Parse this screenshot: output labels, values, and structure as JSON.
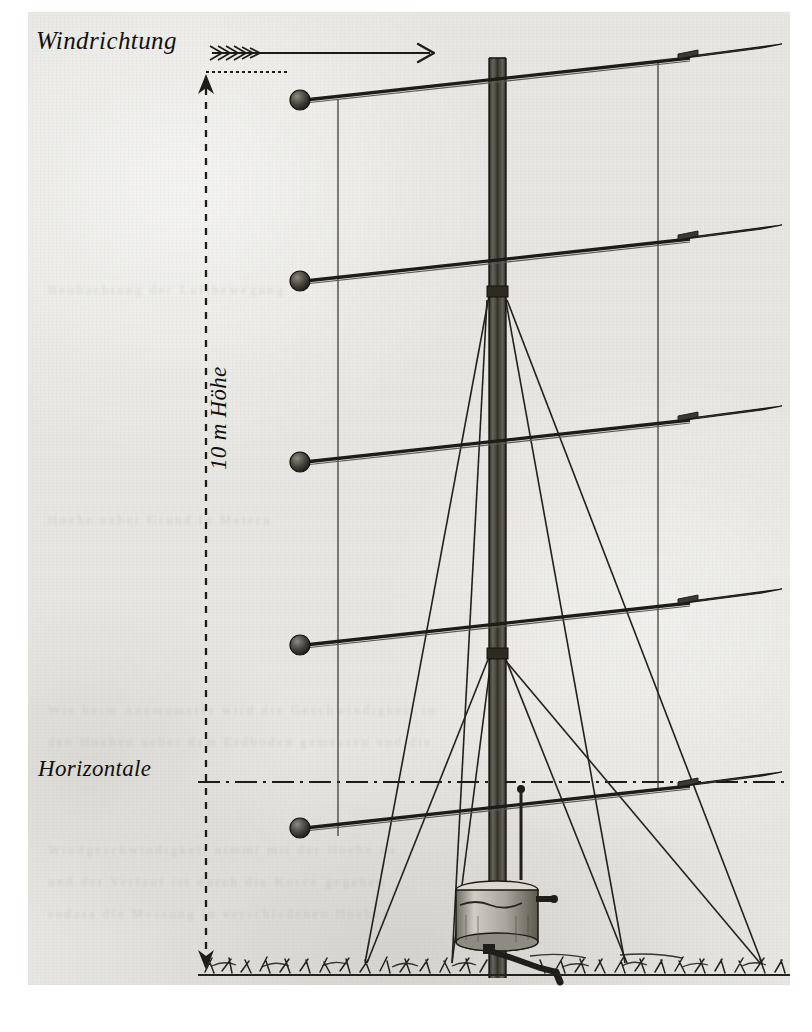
{
  "figure": {
    "kind": "technical-illustration",
    "labels": {
      "wind_direction": "Windrichtung",
      "height": "10 m Höhe",
      "horizontal": "Horizontale"
    },
    "annotations": {
      "wind_arrow": "feathered-arrow-pointing-right",
      "height_dimension": "vertical-dashed-double-arrow",
      "horizontal_datum": "dash-dot-reference-line"
    },
    "mast": {
      "top_y": 58,
      "bottom_y": 975,
      "center_x": 497,
      "guy_collars_y": [
        295,
        655
      ],
      "guy_anchors_x": [
        365,
        450,
        625,
        760
      ],
      "ground_y": 963
    },
    "arms": [
      {
        "index": 1,
        "ball_x": 300,
        "ball_y": 100,
        "vane_label": "Windfahne 1"
      },
      {
        "index": 2,
        "ball_x": 300,
        "ball_y": 281,
        "vane_label": "Windfahne 2"
      },
      {
        "index": 3,
        "ball_x": 300,
        "ball_y": 462,
        "vane_label": "Windfahne 3"
      },
      {
        "index": 4,
        "ball_x": 300,
        "ball_y": 645,
        "vane_label": "Windfahne 4"
      },
      {
        "index": 5,
        "ball_x": 300,
        "ball_y": 828,
        "vane_label": "Windfahne 5"
      }
    ],
    "reference_lines": {
      "left_x": 338,
      "right_x": 658
    },
    "base": {
      "instrument": "Registriertrommel",
      "crank": "Kurbel",
      "ground": "Grasbewuchs"
    },
    "colors": {
      "paper": "#e7e6e2",
      "ink": "#25231f",
      "vane_fill": "#5e5b55",
      "page_white": "#ffffff"
    }
  }
}
